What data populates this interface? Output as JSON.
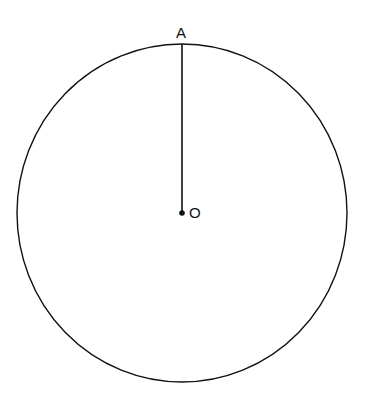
{
  "diagram": {
    "type": "circle-with-radius",
    "circle": {
      "cx": 182,
      "cy": 213,
      "rx": 165,
      "ry": 169,
      "stroke": "#111111"
    },
    "center": {
      "label": "O",
      "x": 182,
      "y": 213
    },
    "point_on_circle": {
      "label": "A",
      "x": 182,
      "y": 44
    },
    "segments": [
      {
        "from": "O",
        "to": "A",
        "name": "radius OA"
      }
    ]
  }
}
